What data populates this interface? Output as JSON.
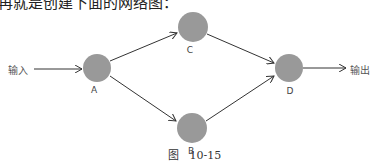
{
  "top_text": "再就是创建下面的网络图：",
  "input_label": "输入",
  "output_label": "输出",
  "nodes": [
    {
      "id": "A",
      "label": "A",
      "cx": 97,
      "cy": 68,
      "r": 14
    },
    {
      "id": "C",
      "label": "C",
      "cx": 193,
      "cy": 27,
      "r": 15
    },
    {
      "id": "B",
      "label": "B",
      "cx": 192,
      "cy": 128,
      "r": 15
    },
    {
      "id": "D",
      "label": "D",
      "cx": 289,
      "cy": 68,
      "r": 14
    }
  ],
  "edges": [
    {
      "from": "输入",
      "to": "A"
    },
    {
      "from": "A",
      "to": "C"
    },
    {
      "from": "A",
      "to": "B"
    },
    {
      "from": "C",
      "to": "D"
    },
    {
      "from": "B",
      "to": "D"
    },
    {
      "from": "D",
      "to": "输出"
    }
  ],
  "colors": {
    "node_fill": "#999999",
    "edge": "#333333"
  },
  "caption": "图   10-15"
}
